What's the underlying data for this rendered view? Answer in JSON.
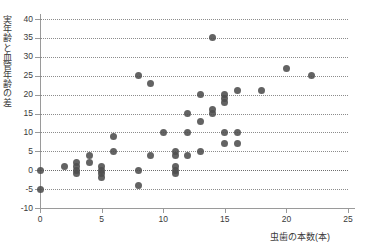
{
  "chart_data": {
    "type": "scatter",
    "title": "",
    "xlabel": "虫歯の本数(本)",
    "ylabel": "実年齢と血管年齢の差",
    "xlim": [
      0,
      25
    ],
    "ylim": [
      -10,
      40
    ],
    "xticks": [
      0,
      5,
      10,
      15,
      20,
      25
    ],
    "yticks": [
      -10,
      -5,
      0,
      5,
      10,
      15,
      20,
      25,
      30,
      35,
      40
    ],
    "xtick_labels": [
      "0",
      "5",
      "10",
      "15",
      "20",
      "25"
    ],
    "ytick_labels": [
      "-10",
      "-5",
      "0",
      "5",
      "10",
      "15",
      "20",
      "25",
      "30",
      "35",
      "40"
    ],
    "grid": true,
    "grid_style": "dotted-horizontal",
    "legend": null,
    "marker_color": "#4d4d4d",
    "marker_size_px": 7,
    "points": [
      {
        "x": 0,
        "y": 0
      },
      {
        "x": 0,
        "y": -5
      },
      {
        "x": 2,
        "y": 1
      },
      {
        "x": 3,
        "y": 2
      },
      {
        "x": 3,
        "y": 1
      },
      {
        "x": 3,
        "y": 0
      },
      {
        "x": 3,
        "y": -1
      },
      {
        "x": 4,
        "y": 4
      },
      {
        "x": 4,
        "y": 2
      },
      {
        "x": 5,
        "y": 1
      },
      {
        "x": 5,
        "y": 0
      },
      {
        "x": 5,
        "y": -1
      },
      {
        "x": 5,
        "y": -2
      },
      {
        "x": 6,
        "y": 9
      },
      {
        "x": 6,
        "y": 5
      },
      {
        "x": 8,
        "y": 25
      },
      {
        "x": 8,
        "y": 0
      },
      {
        "x": 8,
        "y": -4
      },
      {
        "x": 9,
        "y": 23
      },
      {
        "x": 9,
        "y": 4
      },
      {
        "x": 10,
        "y": 10
      },
      {
        "x": 11,
        "y": 5
      },
      {
        "x": 11,
        "y": 4
      },
      {
        "x": 11,
        "y": 1
      },
      {
        "x": 11,
        "y": 0
      },
      {
        "x": 11,
        "y": -1
      },
      {
        "x": 12,
        "y": 15
      },
      {
        "x": 12,
        "y": 10
      },
      {
        "x": 12,
        "y": 4
      },
      {
        "x": 13,
        "y": 20
      },
      {
        "x": 13,
        "y": 13
      },
      {
        "x": 13,
        "y": 5
      },
      {
        "x": 14,
        "y": 35
      },
      {
        "x": 14,
        "y": 16
      },
      {
        "x": 14,
        "y": 15
      },
      {
        "x": 15,
        "y": 20
      },
      {
        "x": 15,
        "y": 19
      },
      {
        "x": 15,
        "y": 18
      },
      {
        "x": 15,
        "y": 10
      },
      {
        "x": 15,
        "y": 7
      },
      {
        "x": 16,
        "y": 21
      },
      {
        "x": 16,
        "y": 10
      },
      {
        "x": 16,
        "y": 7
      },
      {
        "x": 18,
        "y": 21
      },
      {
        "x": 20,
        "y": 27
      },
      {
        "x": 22,
        "y": 25
      }
    ]
  }
}
